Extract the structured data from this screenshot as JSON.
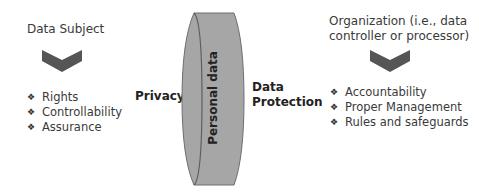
{
  "diagram": {
    "left": {
      "heading": "Data Subject",
      "chevron_icon": "chevron-down-icon",
      "bullet_icon": "diamond-bullet-icon",
      "items": [
        "Rights",
        "Controllability",
        "Assurance"
      ]
    },
    "center": {
      "left_label": "Privacy",
      "cylinder_label": "Personal data",
      "right_label_line1": "Data",
      "right_label_line2": "Protection"
    },
    "right": {
      "heading_line1": "Organization (i.e., data",
      "heading_line2": "controller or processor)",
      "chevron_icon": "chevron-down-icon",
      "bullet_icon": "diamond-bullet-icon",
      "items": [
        "Accountability",
        "Proper Management",
        "Rules and safeguards"
      ]
    },
    "colors": {
      "chevron": "#555555",
      "cylinder_fill": "#a6a6a6",
      "cylinder_stroke": "#6e6e6e",
      "text": "#3a3a3a"
    },
    "bullet_glyph": "❖"
  }
}
